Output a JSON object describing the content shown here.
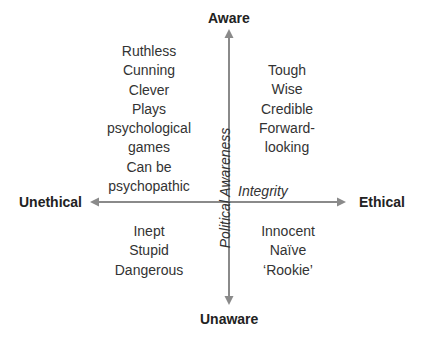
{
  "diagram": {
    "poles": {
      "top": "Aware",
      "bottom": "Unaware",
      "left": "Unethical",
      "right": "Ethical"
    },
    "axes": {
      "vertical": "Political Awareness",
      "horizontal": "Integrity"
    },
    "quadrants": {
      "top_left": [
        "Ruthless",
        "Cunning",
        "Clever",
        "Plays",
        "psychological",
        "games",
        "Can be",
        "psychopathic"
      ],
      "top_right": [
        "Tough",
        "Wise",
        "Credible",
        "Forward-",
        "looking"
      ],
      "bottom_left": [
        "Inept",
        "Stupid",
        "Dangerous"
      ],
      "bottom_right": [
        "Innocent",
        "Naïve",
        "‘Rookie’"
      ]
    },
    "colors": {
      "axis": "#8a8a8a",
      "text": "#333333"
    }
  }
}
